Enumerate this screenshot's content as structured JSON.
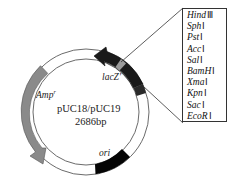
{
  "plasmid": {
    "name": "pUC18/pUC19",
    "size": "2686bp"
  },
  "features": [
    {
      "label": "lacZ'",
      "fill": "#1a1a1a",
      "type": "arrow"
    },
    {
      "label": "Amp",
      "superscript": "r",
      "fill": "#8a8a8a",
      "type": "arrow"
    },
    {
      "label": "ori",
      "fill": "#050505",
      "type": "block"
    }
  ],
  "mcs": {
    "title": "multiple cloning site",
    "sites": [
      {
        "name": "Hind",
        "numeral": "Ⅲ"
      },
      {
        "name": "Sph",
        "numeral": "Ⅰ"
      },
      {
        "name": "Pst",
        "numeral": "Ⅰ"
      },
      {
        "name": "Acc",
        "numeral": "Ⅰ"
      },
      {
        "name": "Sal",
        "numeral": "Ⅰ"
      },
      {
        "name": "BamH",
        "numeral": "Ⅰ"
      },
      {
        "name": "Xma",
        "numeral": "Ⅰ"
      },
      {
        "name": "Kpn",
        "numeral": "Ⅰ"
      },
      {
        "name": "Sac",
        "numeral": "Ⅰ"
      },
      {
        "name": "EcoR",
        "numeral": "Ⅰ"
      }
    ]
  },
  "colors": {
    "ring_stroke": "#6b6b6b",
    "lacZ": "#1a1a1a",
    "mcs_band": "#9a9a9a",
    "amp": "#8a8a8a",
    "ori": "#050505"
  }
}
